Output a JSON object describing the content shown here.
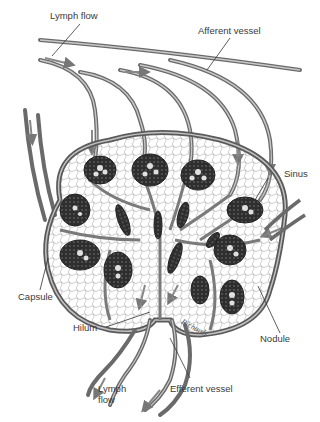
{
  "diagram": {
    "labels": {
      "lymph_flow_top": "Lymph flow",
      "afferent_vessel": "Afferent vessel",
      "sinus": "Sinus",
      "capsule": "Capsule",
      "hilum": "Hilum",
      "nodule": "Nodule",
      "efferent_vessel": "Efferent vessel",
      "lymph_flow_bottom_line1": "Lymph",
      "lymph_flow_bottom_line2": "flow"
    },
    "signature": "Richards",
    "colors": {
      "ink": "#3a3a3a",
      "vessel_fill": "#9a9a9a",
      "nodule_fill": "#2e2e2e",
      "background": "#ffffff"
    }
  }
}
